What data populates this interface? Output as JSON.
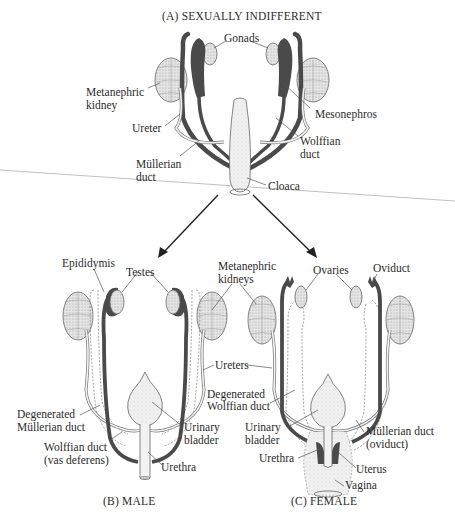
{
  "figure": {
    "panels": {
      "a": {
        "title": "(A)   SEXUALLY INDIFFERENT"
      },
      "b": {
        "title": "(B)   MALE"
      },
      "c": {
        "title": "(C)   FEMALE"
      }
    },
    "labels_a": {
      "gonads": "Gonads",
      "metanephric_kidney_1": "Metanephric",
      "metanephric_kidney_2": "kidney",
      "mesonephros": "Mesonephros",
      "ureter": "Ureter",
      "wolffian_duct_1": "Wolffian",
      "wolffian_duct_2": "duct",
      "mullerian_duct_1": "Müllerian",
      "mullerian_duct_2": "duct",
      "cloaca": "Cloaca"
    },
    "labels_b": {
      "epididymis": "Epididymis",
      "testes": "Testes",
      "degenerated_mullerian_1": "Degenerated",
      "degenerated_mullerian_2": "Müllerian duct",
      "wolffian_vas_1": "Wolffian duct",
      "wolffian_vas_2": "(vas deferens)",
      "urinary_bladder_1": "Urinary",
      "urinary_bladder_2": "bladder",
      "urethra": "Urethra"
    },
    "labels_shared": {
      "metanephric_kidneys_1": "Metanephric",
      "metanephric_kidneys_2": "kidneys",
      "ureters": "Ureters"
    },
    "labels_c": {
      "ovaries": "Ovaries",
      "oviduct": "Oviduct",
      "degenerated_wolffian_1": "Degenerated",
      "degenerated_wolffian_2": "Wolffian duct",
      "urinary_bladder_1": "Urinary",
      "urinary_bladder_2": "bladder",
      "mullerian_oviduct_1": "Müllerian duct",
      "mullerian_oviduct_2": "(oviduct)",
      "urethra": "Urethra",
      "uterus": "Uterus",
      "vagina": "Vagina"
    },
    "colors": {
      "dark_duct": "#4a4a4a",
      "kidney_fill": "#dcdcdc",
      "gonad_fill": "#e6e6e6",
      "leader_line": "#555555",
      "arrow": "#222222",
      "crease_line": "#b0b0b0"
    }
  }
}
